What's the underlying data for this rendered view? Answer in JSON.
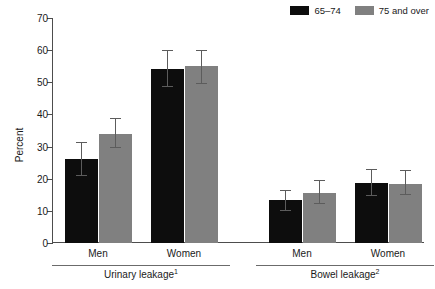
{
  "chart_data": {
    "type": "bar",
    "title": "",
    "xlabel": "",
    "ylabel": "Percent",
    "ylim": [
      0,
      70
    ],
    "ytick_step": 10,
    "yticks": [
      0,
      10,
      20,
      30,
      40,
      50,
      60,
      70
    ],
    "ytick_labels": [
      "0",
      "10",
      "20",
      "30",
      "40",
      "50",
      "60",
      "70"
    ],
    "grid": false,
    "legend_position": "top-right",
    "categories": [
      "Men",
      "Women",
      "Men",
      "Women"
    ],
    "groups": [
      {
        "label": "Urinary leakage",
        "footnote": "1",
        "categories": [
          "Men",
          "Women"
        ]
      },
      {
        "label": "Bowel leakage",
        "footnote": "2",
        "categories": [
          "Men",
          "Women"
        ]
      }
    ],
    "series": [
      {
        "name": "65–74",
        "color": "#0d0d0d",
        "values": [
          26.0,
          54.2,
          13.3,
          18.7
        ],
        "err_low": [
          5.0,
          5.7,
          3.2,
          4.1
        ],
        "err_high": [
          5.2,
          5.5,
          3.0,
          4.1
        ]
      },
      {
        "name": "75 and over",
        "color": "#808080",
        "values": [
          34.0,
          55.1,
          15.7,
          18.5
        ],
        "err_low": [
          4.5,
          5.5,
          3.5,
          3.6
        ],
        "err_high": [
          4.5,
          4.6,
          3.6,
          3.9
        ]
      }
    ]
  },
  "legend": {
    "entries": [
      {
        "label": "65–74",
        "color": "#0d0d0d"
      },
      {
        "label": "75 and over",
        "color": "#808080"
      }
    ]
  },
  "axis": {
    "y_title": "Percent"
  }
}
